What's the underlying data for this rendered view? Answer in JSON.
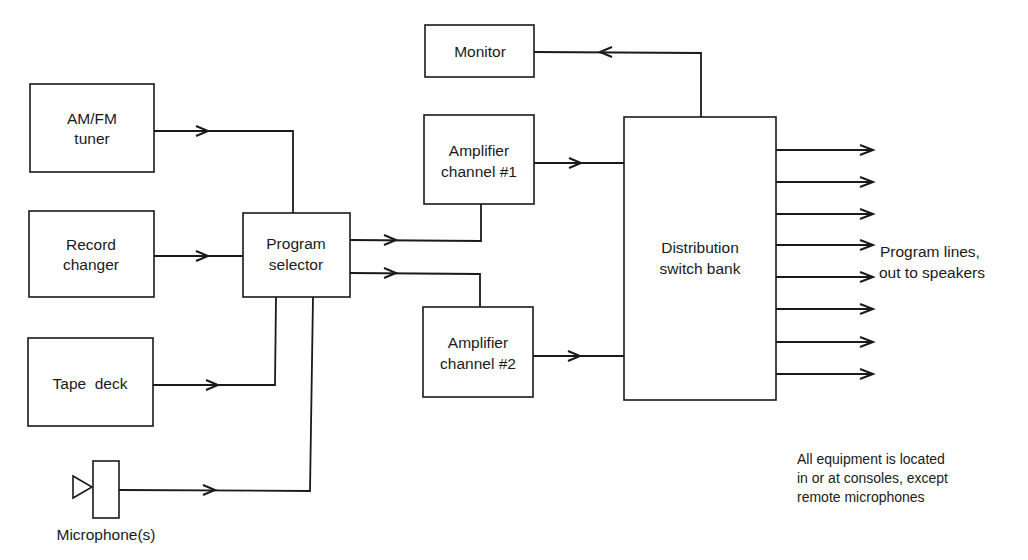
{
  "diagram": {
    "type": "block-diagram",
    "blocks": {
      "tuner": {
        "line1": "AM/FM",
        "line2": "tuner"
      },
      "record_changer": {
        "line1": "Record",
        "line2": "changer"
      },
      "tape_deck": {
        "line1": "Tape  deck"
      },
      "microphone": {
        "label": "Microphone(s)"
      },
      "program_selector": {
        "line1": "Program",
        "line2": "selector"
      },
      "monitor": {
        "line1": "Monitor"
      },
      "amp1": {
        "line1": "Amplifier",
        "line2": "channel #1"
      },
      "amp2": {
        "line1": "Amplifier",
        "line2": "channel #2"
      },
      "distribution": {
        "line1": "Distribution",
        "line2": "switch bank"
      }
    },
    "outputs": {
      "count": 8,
      "label_line1": "Program lines,",
      "label_line2": "out to speakers"
    },
    "note": {
      "line1": "All equipment is located",
      "line2": "in or at consoles, except",
      "line3": "remote microphones"
    },
    "connections": [
      {
        "from": "AM/FM tuner",
        "to": "Program selector"
      },
      {
        "from": "Record changer",
        "to": "Program selector"
      },
      {
        "from": "Tape deck",
        "to": "Program selector"
      },
      {
        "from": "Microphone(s)",
        "to": "Program selector"
      },
      {
        "from": "Program selector",
        "to": "Amplifier channel #1"
      },
      {
        "from": "Program selector",
        "to": "Amplifier channel #2"
      },
      {
        "from": "Amplifier channel #1",
        "to": "Distribution switch bank"
      },
      {
        "from": "Amplifier channel #2",
        "to": "Distribution switch bank"
      },
      {
        "from": "Distribution switch bank",
        "to": "Monitor"
      },
      {
        "from": "Distribution switch bank",
        "to": "Program lines, out to speakers",
        "count": 8
      }
    ]
  }
}
